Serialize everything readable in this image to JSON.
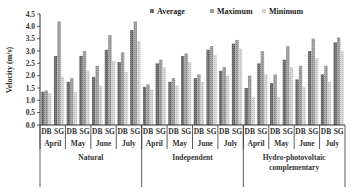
{
  "chart_data": {
    "type": "bar",
    "title": "",
    "xlabel": "",
    "ylabel": "Velocity (m/s)",
    "ylim": [
      0,
      4.5
    ],
    "yticks": [
      "0.0",
      "0.5",
      "1.0",
      "1.5",
      "2.0",
      "2.5",
      "3.0",
      "3.5",
      "4.0",
      "4.5"
    ],
    "grid": false,
    "legend_position": "top",
    "legend": [
      "Average",
      "Maximum",
      "Minimum"
    ],
    "colors": {
      "Average": "#6e6e6e",
      "Maximum": "#9a9a9a",
      "Minimum": "#cfcfcf"
    },
    "scenarios": [
      "Natural",
      "Independent",
      "Hydro-photovoltaic complementary"
    ],
    "months": [
      "April",
      "May",
      "June",
      "July"
    ],
    "stations": [
      "DB",
      "SG"
    ],
    "categories": [
      "Natural-April-DB",
      "Natural-April-SG",
      "Natural-May-DB",
      "Natural-May-SG",
      "Natural-June-DB",
      "Natural-June-SG",
      "Natural-July-DB",
      "Natural-July-SG",
      "Independent-April-DB",
      "Independent-April-SG",
      "Independent-May-DB",
      "Independent-May-SG",
      "Independent-June-DB",
      "Independent-June-SG",
      "Independent-July-DB",
      "Independent-July-SG",
      "Hydro-April-DB",
      "Hydro-April-SG",
      "Hydro-May-DB",
      "Hydro-May-SG",
      "Hydro-June-DB",
      "Hydro-June-SG",
      "Hydro-July-DB",
      "Hydro-July-SG"
    ],
    "series": [
      {
        "name": "Average",
        "values": [
          1.35,
          2.8,
          1.75,
          2.8,
          1.95,
          3.05,
          2.55,
          3.85,
          1.55,
          2.5,
          1.75,
          2.8,
          1.9,
          3.05,
          2.2,
          3.3,
          1.5,
          2.5,
          1.7,
          2.65,
          1.85,
          3.0,
          2.05,
          3.35
        ]
      },
      {
        "name": "Maximum",
        "values": [
          1.4,
          4.2,
          1.9,
          3.0,
          2.4,
          3.65,
          2.95,
          4.2,
          1.65,
          2.65,
          1.9,
          2.9,
          2.05,
          3.2,
          2.35,
          3.45,
          2.0,
          3.0,
          2.05,
          3.2,
          2.4,
          3.5,
          2.4,
          3.55
        ]
      },
      {
        "name": "Minimum",
        "values": [
          1.3,
          1.95,
          1.35,
          2.2,
          1.6,
          2.6,
          2.15,
          3.4,
          1.45,
          2.35,
          1.6,
          2.55,
          1.75,
          2.85,
          2.0,
          3.1,
          1.15,
          2.05,
          1.15,
          2.35,
          1.55,
          2.7,
          1.75,
          3.0
        ]
      }
    ]
  },
  "scenario_labels": [
    "Natural",
    "Independent",
    "Hydro-photovoltaic",
    "complementary"
  ]
}
